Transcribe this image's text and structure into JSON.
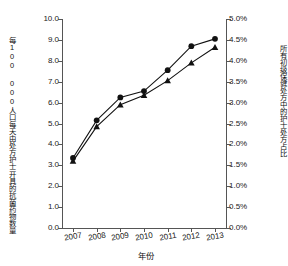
{
  "chart_data": {
    "type": "line",
    "title": "",
    "xlabel": "年份",
    "ylabel": "每100 000人口每天由处方护士开具的抗菌药物数量",
    "ylabel_line1": "每100 000人口每天由处方护士",
    "ylabel_line2": "开具的抗菌药物数量",
    "ylabel_right": "所有初级保健处方中的护士处方占比",
    "categories": [
      "2007",
      "2008",
      "2009",
      "2010",
      "2011",
      "2012",
      "2013"
    ],
    "x": [
      2007,
      2008,
      2009,
      2010,
      2011,
      2012,
      2013
    ],
    "ylim": [
      0,
      10
    ],
    "ylim_right": [
      0,
      5
    ],
    "yticks": [
      "0.0",
      "1.0",
      "2.0",
      "3.0",
      "4.0",
      "5.0",
      "6.0",
      "7.0",
      "8.0",
      "9.0",
      "10.0"
    ],
    "yticks_right": [
      "0.0%",
      "0.5%",
      "1.0%",
      "1.5%",
      "2.0%",
      "2.5%",
      "3.0%",
      "3.5%",
      "4.0%",
      "4.5%",
      "5.0%"
    ],
    "grid": false,
    "legend": "none",
    "series": [
      {
        "name": "抗菌药物数量",
        "marker": "circle",
        "axis": "left",
        "values": [
          3.35,
          5.15,
          6.25,
          6.55,
          7.55,
          8.7,
          9.05
        ]
      },
      {
        "name": "护士处方占比",
        "marker": "triangle",
        "axis": "right",
        "values": [
          3.2,
          4.85,
          5.9,
          6.35,
          7.05,
          7.9,
          8.65
        ],
        "values_pct": [
          1.6,
          2.42,
          2.95,
          3.18,
          3.53,
          3.95,
          4.33
        ]
      }
    ],
    "colors": {
      "series1": "#111111",
      "series2": "#111111",
      "axis": "#555555",
      "background": "#ffffff"
    }
  }
}
